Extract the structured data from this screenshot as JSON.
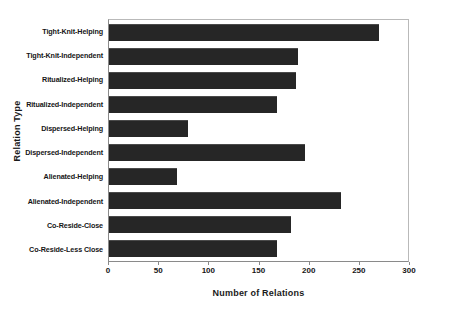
{
  "chart_data": {
    "type": "bar",
    "orientation": "horizontal",
    "title": "",
    "xlabel": "Number of Relations",
    "ylabel": "Relation Type",
    "xlim": [
      0,
      300
    ],
    "xticks": [
      0,
      50,
      100,
      150,
      200,
      250,
      300
    ],
    "xtick_labels": [
      "0",
      "50",
      "100",
      "150",
      "200",
      "250",
      "300"
    ],
    "grid": false,
    "legend": null,
    "bar_color": "#262626",
    "categories": [
      "Tight-Knit-Helping",
      "Tight-Knit-Independent",
      "Ritualized-Helping",
      "Ritualized-Independent",
      "Dispersed-Helping",
      "Dispersed-Independent",
      "Alienated-Helping",
      "Alienated-Independent",
      "Co-Reside-Close",
      "Co-Reside-Less Close"
    ],
    "values": [
      269,
      188,
      186,
      167,
      79,
      195,
      68,
      231,
      181,
      167
    ]
  }
}
